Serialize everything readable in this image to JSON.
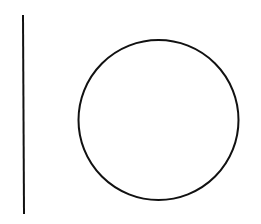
{
  "diagram": {
    "background": "#ffffff",
    "stroke_color": "#111111",
    "shapes": [
      {
        "type": "line",
        "name": "vertical-line",
        "x1": 23,
        "y1": 15,
        "x2": 24,
        "y2": 214,
        "stroke_width": 2
      },
      {
        "type": "circle",
        "name": "circle",
        "cx": 158.5,
        "cy": 120,
        "r": 80,
        "stroke_width": 2
      }
    ]
  }
}
